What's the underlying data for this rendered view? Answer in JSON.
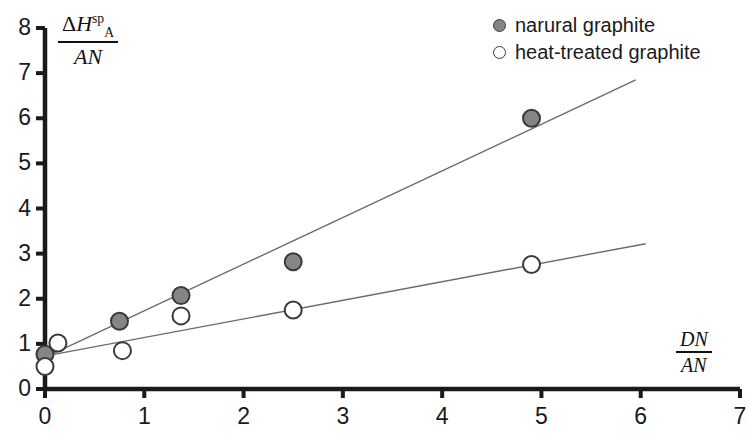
{
  "chart_data": {
    "type": "scatter",
    "title": "",
    "xlabel": "DN/AN",
    "ylabel": "ΔH_A^sp / AN",
    "xlim": [
      0,
      7
    ],
    "ylim": [
      0,
      8
    ],
    "xticks": [
      0,
      1,
      2,
      3,
      4,
      5,
      6,
      7
    ],
    "yticks": [
      0,
      1,
      2,
      3,
      4,
      5,
      6,
      7,
      8
    ],
    "grid": false,
    "legend_position": "top-right",
    "series": [
      {
        "name": "narural graphite",
        "marker": "filled-circle",
        "color": "#858585",
        "edge_color": "#3a3a3a",
        "points": [
          {
            "x": 0.0,
            "y": 0.77
          },
          {
            "x": 0.75,
            "y": 1.5
          },
          {
            "x": 1.37,
            "y": 2.07
          },
          {
            "x": 2.5,
            "y": 2.82
          },
          {
            "x": 4.9,
            "y": 6.0
          }
        ],
        "trendline": {
          "x0": 0.05,
          "y0": 0.75,
          "x1": 5.95,
          "y1": 6.85
        }
      },
      {
        "name": "heat-treated graphite",
        "marker": "open-circle",
        "color": "#ffffff",
        "edge_color": "#3a3a3a",
        "points": [
          {
            "x": 0.0,
            "y": 0.5
          },
          {
            "x": 0.13,
            "y": 1.02
          },
          {
            "x": 0.78,
            "y": 0.85
          },
          {
            "x": 1.37,
            "y": 1.62
          },
          {
            "x": 2.5,
            "y": 1.75
          },
          {
            "x": 4.9,
            "y": 2.76
          }
        ],
        "trendline": {
          "x0": 0.05,
          "y0": 0.75,
          "x1": 6.05,
          "y1": 3.22
        }
      }
    ]
  },
  "axes": {
    "y_title": {
      "numerator_delta": "Δ",
      "numerator_symbol": "H",
      "numerator_sup": "sp",
      "numerator_sub": "A",
      "denominator": "AN"
    },
    "x_title": {
      "numerator": "DN",
      "denominator": "AN"
    },
    "x_tick_labels": [
      "0",
      "1",
      "2",
      "3",
      "4",
      "5",
      "6",
      "7"
    ],
    "y_tick_labels": [
      "0",
      "1",
      "2",
      "3",
      "4",
      "5",
      "6",
      "7",
      "8"
    ]
  },
  "legend": {
    "items": [
      {
        "label": "narural graphite",
        "marker": "filled"
      },
      {
        "label": "heat-treated graphite",
        "marker": "open"
      }
    ]
  },
  "colors": {
    "axis": "#1a1a1a",
    "marker_fill": "#858585",
    "marker_edge": "#3a3a3a",
    "trendline": "#6b6b6b",
    "background": "#ffffff"
  }
}
